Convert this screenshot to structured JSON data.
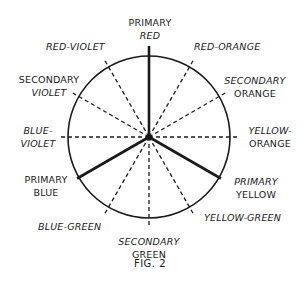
{
  "diagram": {
    "type": "color-wheel",
    "center": [
      149,
      137
    ],
    "radius": 81,
    "spoke_length": 91,
    "colors": {
      "ink": "#1a1a1a",
      "background": "#ffffff"
    },
    "segments": [
      {
        "id": "primary-red",
        "angle": -90,
        "style": "solid",
        "line1": "PRIMARY",
        "line2": "RED"
      },
      {
        "id": "red-orange",
        "angle": -60,
        "style": "dashed",
        "line1": "RED-ORANGE",
        "line2": ""
      },
      {
        "id": "secondary-orange",
        "angle": -30,
        "style": "dashed",
        "line1": "SECONDARY",
        "line2": "ORANGE"
      },
      {
        "id": "yellow-orange",
        "angle": 0,
        "style": "dashed",
        "line1": "YELLOW-",
        "line2": "ORANGE"
      },
      {
        "id": "primary-yellow",
        "angle": 30,
        "style": "solid",
        "line1": "PRIMARY",
        "line2": "YELLOW"
      },
      {
        "id": "yellow-green",
        "angle": 60,
        "style": "dashed",
        "line1": "YELLOW-GREEN",
        "line2": ""
      },
      {
        "id": "secondary-green",
        "angle": 90,
        "style": "dashed",
        "line1": "SECONDARY",
        "line2": "GREEN"
      },
      {
        "id": "blue-green",
        "angle": 120,
        "style": "dashed",
        "line1": "BLUE-GREEN",
        "line2": ""
      },
      {
        "id": "primary-blue",
        "angle": 150,
        "style": "solid",
        "line1": "PRIMARY",
        "line2": "BLUE"
      },
      {
        "id": "blue-violet",
        "angle": 180,
        "style": "dashed",
        "line1": "BLUE-",
        "line2": "VIOLET"
      },
      {
        "id": "secondary-violet",
        "angle": 210,
        "style": "dashed",
        "line1": "SECONDARY",
        "line2": "VIOLET"
      },
      {
        "id": "red-violet",
        "angle": 240,
        "style": "dashed",
        "line1": "RED-VIOLET",
        "line2": ""
      }
    ]
  },
  "labels": {
    "primary_red": {
      "l1": "PRIMARY",
      "l2": "RED"
    },
    "red_orange": {
      "l1": "RED-ORANGE"
    },
    "secondary_orange": {
      "l1": "SECONDARY",
      "l2": "ORANGE"
    },
    "yellow_orange": {
      "l1": "YELLOW-",
      "l2": "ORANGE"
    },
    "primary_yellow": {
      "l1": "PRIMARY",
      "l2": "YELLOW"
    },
    "yellow_green": {
      "l1": "YELLOW-GREEN"
    },
    "secondary_green": {
      "l1": "SECONDARY",
      "l2": "GREEN"
    },
    "blue_green": {
      "l1": "BLUE-GREEN"
    },
    "primary_blue": {
      "l1": "PRIMARY",
      "l2": "BLUE"
    },
    "blue_violet": {
      "l1": "BLUE-",
      "l2": "VIOLET"
    },
    "secondary_violet": {
      "l1": "SECONDARY",
      "l2": "VIOLET"
    },
    "red_violet": {
      "l1": "RED-VIOLET"
    }
  },
  "caption": "FIG.  2"
}
